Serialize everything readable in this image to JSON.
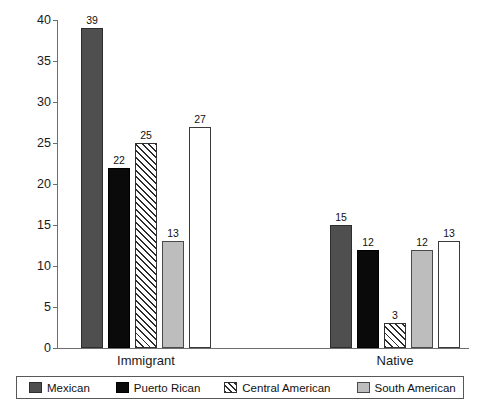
{
  "chart_data": {
    "type": "bar",
    "title": "",
    "xlabel": "",
    "ylabel": "Percentage of 16-to-19 Year Olds",
    "ylim": [
      0,
      40
    ],
    "yticks": [
      0,
      5,
      10,
      15,
      20,
      25,
      30,
      35,
      40
    ],
    "ytick_labels": [
      "0",
      "5",
      "10",
      "15",
      "20",
      "25",
      "30",
      "35",
      "40"
    ],
    "grid": false,
    "legend_position": "bottom",
    "categories": [
      "Immigrant",
      "Native"
    ],
    "series": [
      {
        "name": "Mexican",
        "values": [
          39,
          15
        ],
        "color": "#4f4f4f",
        "style": "solid"
      },
      {
        "name": "Puerto Rican",
        "values": [
          22,
          12
        ],
        "color": "#0a0a0a",
        "style": "solid"
      },
      {
        "name": "Central American",
        "values": [
          25,
          3
        ],
        "color": "#ffffff",
        "style": "hatched"
      },
      {
        "name": "South American",
        "values": [
          13,
          12
        ],
        "color": "#bdbdbd",
        "style": "solid"
      },
      {
        "name": "Other Latino",
        "values": [
          27,
          13
        ],
        "color": "#ffffff",
        "style": "open"
      }
    ]
  }
}
